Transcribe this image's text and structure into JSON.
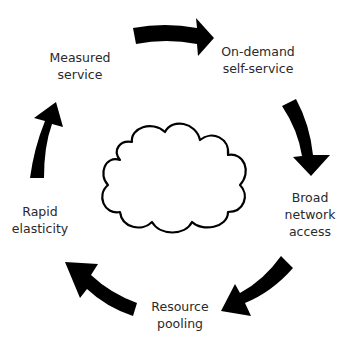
{
  "diagram": {
    "center_icon": "cloud-icon",
    "nodes": [
      {
        "id": "on-demand",
        "line1": "On-demand",
        "line2": "self-service",
        "line3": ""
      },
      {
        "id": "broad-network",
        "line1": "Broad",
        "line2": "network",
        "line3": "access"
      },
      {
        "id": "resource-pooling",
        "line1": "Resource",
        "line2": "pooling",
        "line3": ""
      },
      {
        "id": "rapid-elasticity",
        "line1": "Rapid",
        "line2": "elasticity",
        "line3": ""
      },
      {
        "id": "measured-service",
        "line1": "Measured",
        "line2": "service",
        "line3": ""
      }
    ],
    "edges": [
      {
        "from": "measured-service",
        "to": "on-demand"
      },
      {
        "from": "on-demand",
        "to": "broad-network"
      },
      {
        "from": "broad-network",
        "to": "resource-pooling"
      },
      {
        "from": "resource-pooling",
        "to": "rapid-elasticity"
      },
      {
        "from": "rapid-elasticity",
        "to": "measured-service"
      }
    ],
    "colors": {
      "arrow": "#000000",
      "cloud_stroke": "#000000",
      "text": "#2a2a2a",
      "background": "#ffffff"
    }
  }
}
